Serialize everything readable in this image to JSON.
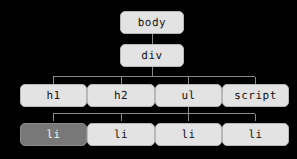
{
  "diagram": {
    "background_color": "#000000",
    "node_fill": "#e3e3e3",
    "node_border": "#b8b8b8",
    "node_text": "#161616",
    "selected_fill": "#787878",
    "selected_text": "#f2f2f2",
    "edge_color": "#8a8a8a",
    "nodes": [
      {
        "id": "body",
        "label": "body",
        "x": 120,
        "y": 11,
        "w": 64,
        "h": 23,
        "selected": false
      },
      {
        "id": "div",
        "label": "div",
        "x": 120,
        "y": 44,
        "w": 64,
        "h": 23,
        "selected": false
      },
      {
        "id": "h1",
        "label": "h1",
        "x": 20,
        "y": 84,
        "w": 67,
        "h": 23,
        "selected": false
      },
      {
        "id": "h2",
        "label": "h2",
        "x": 87,
        "y": 84,
        "w": 68,
        "h": 23,
        "selected": false
      },
      {
        "id": "ul",
        "label": "ul",
        "x": 155,
        "y": 84,
        "w": 67,
        "h": 23,
        "selected": false
      },
      {
        "id": "script",
        "label": "script",
        "x": 222,
        "y": 84,
        "w": 67,
        "h": 23,
        "selected": false
      },
      {
        "id": "li1",
        "label": "li",
        "x": 20,
        "y": 123,
        "w": 67,
        "h": 23,
        "selected": true
      },
      {
        "id": "li2",
        "label": "li",
        "x": 87,
        "y": 123,
        "w": 68,
        "h": 23,
        "selected": false
      },
      {
        "id": "li3",
        "label": "li",
        "x": 155,
        "y": 123,
        "w": 67,
        "h": 23,
        "selected": false
      },
      {
        "id": "li4",
        "label": "li",
        "x": 222,
        "y": 123,
        "w": 67,
        "h": 23,
        "selected": false
      }
    ],
    "edges": [
      {
        "from": "body",
        "to": "div"
      },
      {
        "from": "div",
        "to": "h1"
      },
      {
        "from": "div",
        "to": "h2"
      },
      {
        "from": "div",
        "to": "ul"
      },
      {
        "from": "div",
        "to": "script"
      },
      {
        "from": "ul",
        "to": "li1"
      },
      {
        "from": "ul",
        "to": "li2"
      },
      {
        "from": "ul",
        "to": "li3"
      },
      {
        "from": "ul",
        "to": "li4"
      }
    ],
    "edge_geometry": {
      "body_div": {
        "x": 152,
        "y1": 34,
        "y2": 44
      },
      "row3_bus": {
        "y": 76,
        "x_left": 53,
        "x_right": 255,
        "parent_x": 152,
        "parent_y": 67,
        "children_x": [
          53,
          121,
          188,
          255
        ]
      },
      "row4_bus": {
        "y": 113,
        "x_left": 53,
        "x_right": 255,
        "parent_x": 188,
        "parent_y": 107,
        "children_x": [
          53,
          121,
          188,
          255
        ]
      }
    }
  }
}
